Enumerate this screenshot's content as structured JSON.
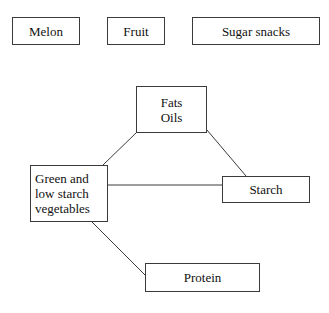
{
  "diagram": {
    "background_color": "#ffffff",
    "border_color": "#3a3a3a",
    "text_color": "#111111",
    "standalone_nodes": [
      {
        "id": "melon",
        "label": "Melon"
      },
      {
        "id": "fruit",
        "label": "Fruit"
      },
      {
        "id": "sugar-snacks",
        "label": "Sugar snacks"
      }
    ],
    "connected_nodes": [
      {
        "id": "fats-oils",
        "line1": "Fats",
        "line2": "Oils"
      },
      {
        "id": "vegetables",
        "line1": "Green and",
        "line2": "low starch",
        "line3": "vegetables"
      },
      {
        "id": "starch",
        "label": "Starch"
      },
      {
        "id": "protein",
        "label": "Protein"
      }
    ],
    "connections": [
      {
        "from": "fats-oils",
        "to": "vegetables",
        "style": "diagonal"
      },
      {
        "from": "fats-oils",
        "to": "starch",
        "style": "diagonal"
      },
      {
        "from": "vegetables",
        "to": "starch",
        "style": "horizontal"
      },
      {
        "from": "vegetables",
        "to": "protein",
        "style": "diagonal"
      }
    ]
  }
}
